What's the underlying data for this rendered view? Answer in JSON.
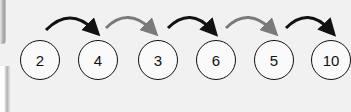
{
  "sequence": {
    "nodes": [
      {
        "label": "2"
      },
      {
        "label": "4"
      },
      {
        "label": "3"
      },
      {
        "label": "6"
      },
      {
        "label": "5"
      },
      {
        "label": "10"
      }
    ],
    "arrows": [
      {
        "from": "2",
        "to": "4",
        "color": "#111111"
      },
      {
        "from": "4",
        "to": "3",
        "color": "#7a7a7a"
      },
      {
        "from": "3",
        "to": "6",
        "color": "#111111"
      },
      {
        "from": "6",
        "to": "5",
        "color": "#7a7a7a"
      },
      {
        "from": "5",
        "to": "10",
        "color": "#111111"
      }
    ]
  }
}
